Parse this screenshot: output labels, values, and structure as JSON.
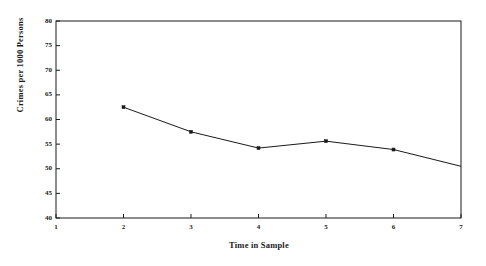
{
  "chart_data": {
    "type": "line",
    "title": "",
    "xlabel": "Time in Sample",
    "ylabel": "Crimes per 1000 Persons",
    "x": [
      2,
      3,
      4,
      5,
      6,
      7
    ],
    "values": [
      62.5,
      57.5,
      54.2,
      55.6,
      53.9,
      50.5
    ],
    "series": [
      {
        "name": "Crimes per 1000 Persons",
        "x": [
          2,
          3,
          4,
          5,
          6,
          7
        ],
        "values": [
          62.5,
          57.5,
          54.2,
          55.6,
          53.9,
          50.5
        ]
      }
    ],
    "xlim": [
      1,
      7
    ],
    "ylim": [
      40,
      80
    ],
    "xticks": [
      1,
      2,
      3,
      4,
      5,
      6,
      7
    ],
    "yticks": [
      40,
      45,
      50,
      55,
      60,
      65,
      70,
      75,
      80
    ],
    "xtick_labels": [
      "1",
      "2",
      "3",
      "4",
      "5",
      "6",
      "7"
    ],
    "ytick_labels": [
      "40",
      "45",
      "50",
      "55",
      "60",
      "65",
      "70",
      "75",
      "80"
    ],
    "grid": false,
    "legend": null,
    "marker": "square",
    "line_color": "#1a1a1a",
    "marker_color": "#1a1a1a",
    "background_color": "#ffffff",
    "frame": "box"
  }
}
